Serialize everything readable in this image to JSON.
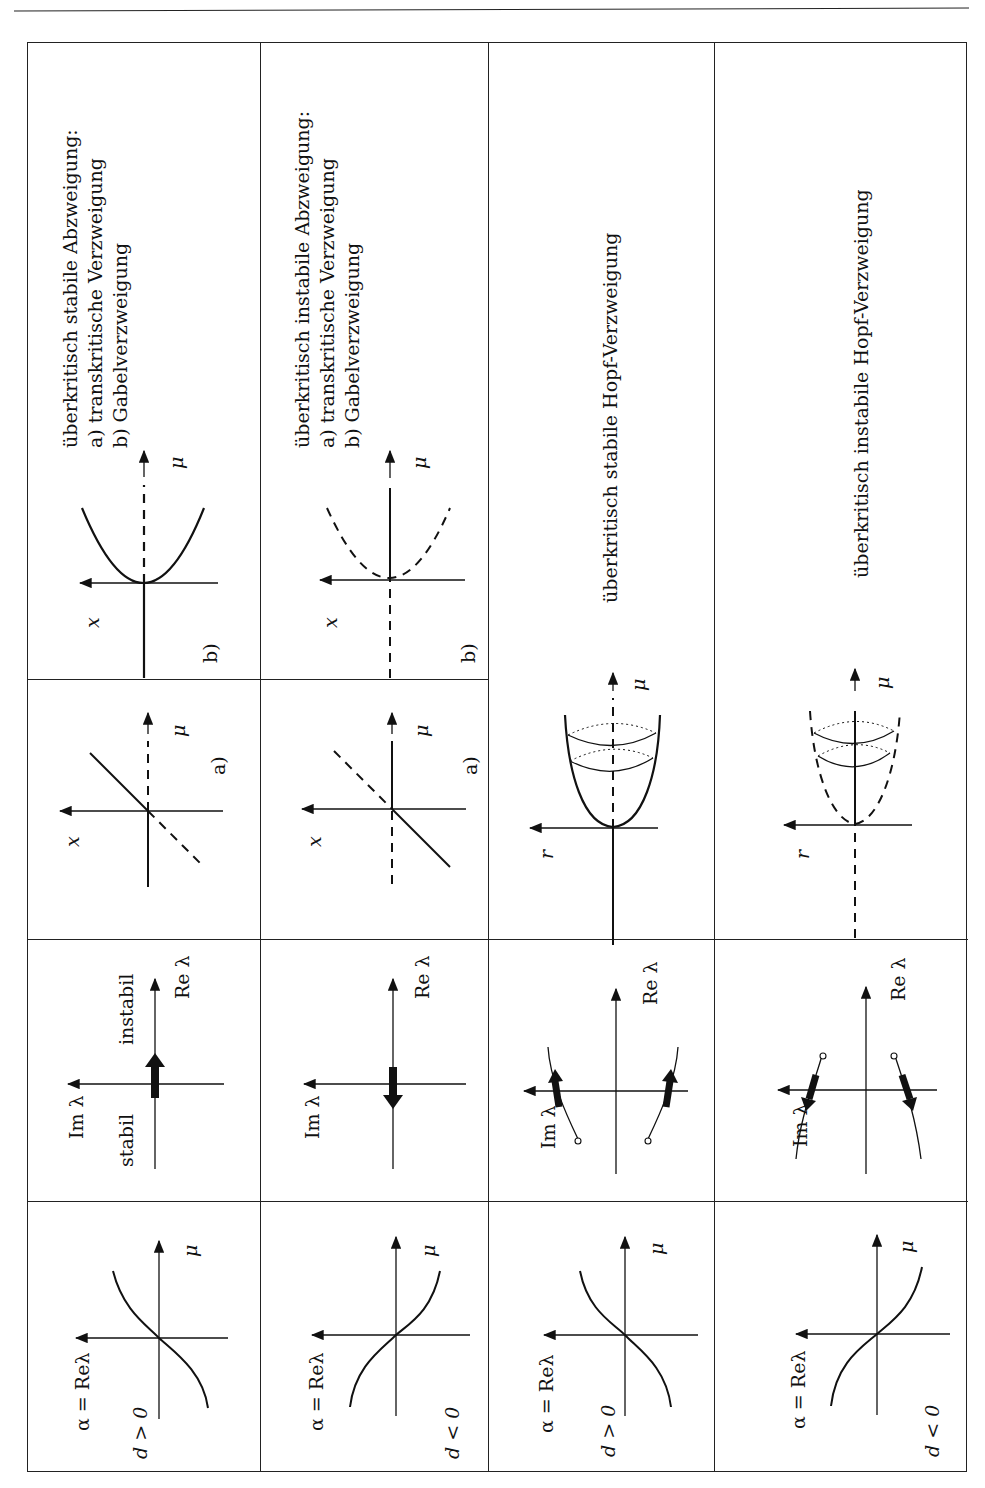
{
  "page": {
    "orientation": "rotated-90-ccw",
    "columns": [
      {
        "id": "col1",
        "description": {
          "title": "überkritisch stabile Abzweigung:",
          "item_a": "a)  transkritische Verzweigung",
          "item_b": "b)  Gabelverzweigung"
        },
        "diagram_b": {
          "label": "b)",
          "x_axis": "x",
          "mu_axis": "μ"
        },
        "diagram_a": {
          "label": "a)",
          "x_axis": "x",
          "mu_axis": "μ"
        },
        "eigen": {
          "im_axis": "Im λ",
          "re_axis": "Re λ",
          "stable": "stabil",
          "unstable": "instabil"
        },
        "alpha": {
          "axis": "α = Reλ",
          "mu_axis": "μ",
          "condition": "d > 0"
        }
      },
      {
        "id": "col2",
        "description": {
          "title": "überkritisch instabile Abzweigung:",
          "item_a": "a)  transkritische Verzweigung",
          "item_b": "b)  Gabelverzweigung"
        },
        "diagram_b": {
          "label": "b)",
          "x_axis": "x",
          "mu_axis": "μ"
        },
        "diagram_a": {
          "label": "a)",
          "x_axis": "x",
          "mu_axis": "μ"
        },
        "eigen": {
          "im_axis": "Im λ",
          "re_axis": "Re λ"
        },
        "alpha": {
          "axis": "α = Reλ",
          "mu_axis": "μ",
          "condition": "d < 0"
        }
      },
      {
        "id": "col3",
        "description": {
          "title": "überkritisch stabile Hopf-Verzweigung"
        },
        "diagram": {
          "r_axis": "r",
          "mu_axis": "μ"
        },
        "eigen": {
          "im_axis": "Im λ",
          "re_axis": "Re λ"
        },
        "alpha": {
          "axis": "α = Reλ",
          "mu_axis": "μ",
          "condition": "d > 0"
        }
      },
      {
        "id": "col4",
        "description": {
          "title": "überkritisch instabile Hopf-Verzweigung"
        },
        "diagram": {
          "r_axis": "r",
          "mu_axis": "μ"
        },
        "eigen": {
          "im_axis": "Im λ",
          "re_axis": "Re λ"
        },
        "alpha": {
          "axis": "α = Reλ",
          "mu_axis": "μ",
          "condition": "d < 0"
        }
      }
    ]
  }
}
